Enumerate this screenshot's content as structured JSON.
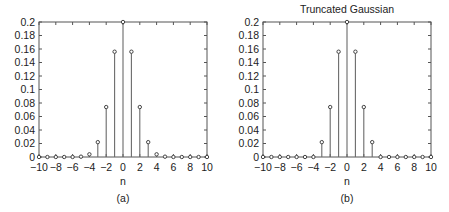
{
  "chart_data": [
    {
      "type": "stem",
      "panel_label": "(a)",
      "title": "",
      "xlabel": "n",
      "ylabel": "",
      "xlim": [
        -10,
        10
      ],
      "ylim": [
        0,
        0.2
      ],
      "xticks": [
        -10,
        -8,
        -6,
        -4,
        -2,
        0,
        2,
        4,
        6,
        8,
        10
      ],
      "xtick_labels": [
        "−10",
        "−8",
        "−6",
        "−4",
        "−2",
        "0",
        "2",
        "4",
        "6",
        "8",
        "10"
      ],
      "yticks": [
        0,
        0.02,
        0.04,
        0.06,
        0.08,
        0.1,
        0.12,
        0.14,
        0.16,
        0.18,
        0.2
      ],
      "ytick_labels": [
        "0",
        "0.02",
        "0.04",
        "0.06",
        "0.08",
        "0.1",
        "0.12",
        "0.14",
        "0.16",
        "0.18",
        "0.2"
      ],
      "x": [
        -10,
        -9,
        -8,
        -7,
        -6,
        -5,
        -4,
        -3,
        -2,
        -1,
        0,
        1,
        2,
        3,
        4,
        5,
        6,
        7,
        8,
        9,
        10
      ],
      "values": [
        0,
        0,
        0,
        0,
        0,
        0.0005,
        0.004,
        0.022,
        0.074,
        0.156,
        0.2,
        0.156,
        0.074,
        0.022,
        0.004,
        0.0005,
        0,
        0,
        0,
        0,
        0
      ],
      "grid": false
    },
    {
      "type": "stem",
      "panel_label": "(b)",
      "title": "Truncated Gaussian",
      "xlabel": "n",
      "ylabel": "",
      "xlim": [
        -10,
        10
      ],
      "ylim": [
        0,
        0.2
      ],
      "xticks": [
        -10,
        -8,
        -6,
        -4,
        -2,
        0,
        2,
        4,
        6,
        8,
        10
      ],
      "xtick_labels": [
        "−10",
        "−8",
        "−6",
        "−4",
        "−2",
        "0",
        "2",
        "4",
        "6",
        "8",
        "10"
      ],
      "yticks": [
        0,
        0.02,
        0.04,
        0.06,
        0.08,
        0.1,
        0.12,
        0.14,
        0.16,
        0.18,
        0.2
      ],
      "ytick_labels": [
        "0",
        "0.02",
        "0.04",
        "0.06",
        "0.08",
        "0.1",
        "0.12",
        "0.14",
        "0.16",
        "0.18",
        "0.2"
      ],
      "x": [
        -10,
        -9,
        -8,
        -7,
        -6,
        -5,
        -4,
        -3,
        -2,
        -1,
        0,
        1,
        2,
        3,
        4,
        5,
        6,
        7,
        8,
        9,
        10
      ],
      "values": [
        0,
        0,
        0,
        0,
        0,
        0,
        0,
        0.022,
        0.074,
        0.156,
        0.2,
        0.156,
        0.074,
        0.022,
        0,
        0,
        0,
        0,
        0,
        0,
        0
      ],
      "grid": false
    }
  ],
  "colors": {
    "axis": "#555555",
    "stem": "#6a6a6a",
    "marker": "#444444",
    "text": "#222222"
  }
}
